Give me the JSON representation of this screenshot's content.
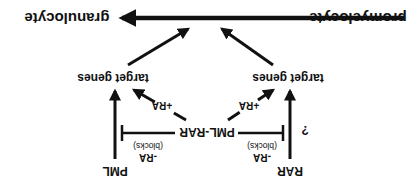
{
  "diagram": {
    "orientation": "rotated-180",
    "nodes": {
      "promyelocyte": "promyelocyte",
      "granulocyte": "granulocyte",
      "target_genes_left": "target genes",
      "target_genes_right": "target genes",
      "pml_rar": "PML-RAR",
      "rar": "RAR",
      "pml": "PML"
    },
    "labels": {
      "plus_ra_left": "+RA",
      "plus_ra_right": "+RA",
      "minus_ra_left": "-RA",
      "minus_ra_right": "-RA",
      "blocks_left": "(blocks)",
      "blocks_right": "(blocks)",
      "question": "?"
    },
    "colors": {
      "ink": "#111111",
      "background": "#ffffff"
    }
  }
}
